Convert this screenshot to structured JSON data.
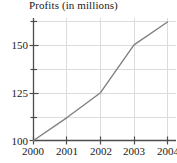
{
  "chart_data": {
    "type": "line",
    "title": "Profits (in millions)",
    "xlabel": "",
    "ylabel": "",
    "x": [
      "2000",
      "2001",
      "2002",
      "2003",
      "2004"
    ],
    "categories": [
      "2000",
      "2001",
      "2002",
      "2003",
      "2004"
    ],
    "values": [
      100,
      112,
      125,
      150,
      162
    ],
    "series": [
      {
        "name": "Profits",
        "values": [
          100,
          112,
          125,
          150,
          162
        ]
      }
    ],
    "xlim": [
      2000,
      2004
    ],
    "ylim": [
      100,
      162
    ],
    "y_ticks_major": [
      100,
      125,
      150
    ],
    "y_ticks_minor": [
      112.5,
      137.5,
      162.5
    ],
    "y_tick_labels": [
      "100",
      "125",
      "150"
    ],
    "x_tick_labels": [
      "2000",
      "2001",
      "2002",
      "2003",
      "2004"
    ],
    "grid": true,
    "legend": false,
    "legend_position": "none",
    "line_color": "#808080",
    "grid_color": "#d8d8d8",
    "axis_color": "#4d4d4d",
    "text_color": "#1a1a1a"
  },
  "axis": {
    "y_labels": [
      {
        "text": "150",
        "top": "39px"
      },
      {
        "text": "125",
        "top": "87px"
      },
      {
        "text": "100",
        "top": "135px"
      }
    ],
    "x_labels": [
      {
        "text": "2000",
        "left": "16px"
      },
      {
        "text": "2001",
        "left": "50px"
      },
      {
        "text": "2002",
        "left": "84px"
      },
      {
        "text": "2003",
        "left": "117px"
      },
      {
        "text": "2004",
        "left": "151px"
      }
    ]
  }
}
